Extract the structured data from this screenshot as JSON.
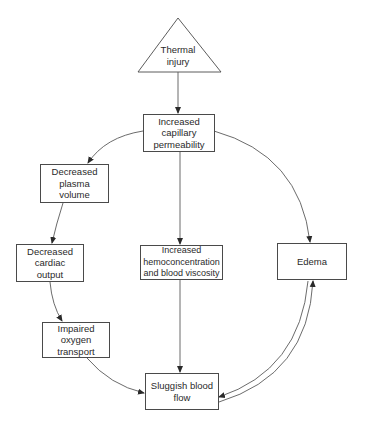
{
  "diagram": {
    "type": "flowchart",
    "nodes": {
      "thermal_injury": {
        "label": "Thermal\ninjury",
        "shape": "triangle"
      },
      "capillary": {
        "label": "Increased\ncapillary\npermeability",
        "shape": "rectangle"
      },
      "plasma": {
        "label": "Decreased\nplasma\nvolume",
        "shape": "rectangle"
      },
      "cardiac": {
        "label": "Decreased\ncardiac\noutput",
        "shape": "rectangle"
      },
      "oxygen": {
        "label": "Impaired\noxygen\ntransport",
        "shape": "rectangle"
      },
      "hemo": {
        "label": "Increased\nhemoconcentration\nand blood viscosity",
        "shape": "rectangle"
      },
      "edema": {
        "label": "Edema",
        "shape": "rectangle"
      },
      "sluggish": {
        "label": "Sluggish blood\nflow",
        "shape": "rectangle"
      }
    },
    "edges": [
      {
        "from": "Thermal injury",
        "to": "Increased capillary permeability"
      },
      {
        "from": "Increased capillary permeability",
        "to": "Decreased plasma volume"
      },
      {
        "from": "Increased capillary permeability",
        "to": "Increased hemoconcentration and blood viscosity"
      },
      {
        "from": "Increased capillary permeability",
        "to": "Edema"
      },
      {
        "from": "Decreased plasma volume",
        "to": "Decreased cardiac output"
      },
      {
        "from": "Decreased cardiac output",
        "to": "Impaired oxygen transport"
      },
      {
        "from": "Impaired oxygen transport",
        "to": "Sluggish blood flow"
      },
      {
        "from": "Increased hemoconcentration and blood viscosity",
        "to": "Sluggish blood flow"
      },
      {
        "from": "Edema",
        "to": "Sluggish blood flow"
      },
      {
        "from": "Sluggish blood flow",
        "to": "Edema"
      }
    ],
    "colors": {
      "line": "#4a4a4a",
      "text": "#2a2a2a",
      "background": "#ffffff"
    }
  }
}
